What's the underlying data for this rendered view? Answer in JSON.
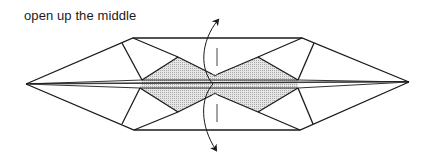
{
  "caption": "open up the middle",
  "diagram": {
    "colors": {
      "line": "#1a1a1a",
      "shade": "#d4d4d4",
      "background": "#ffffff"
    },
    "arrows": [
      {
        "direction": "up",
        "meaning": "open upper layer outward"
      },
      {
        "direction": "down",
        "meaning": "open lower layer outward"
      }
    ],
    "fold_line": "vertical dashed center line"
  }
}
